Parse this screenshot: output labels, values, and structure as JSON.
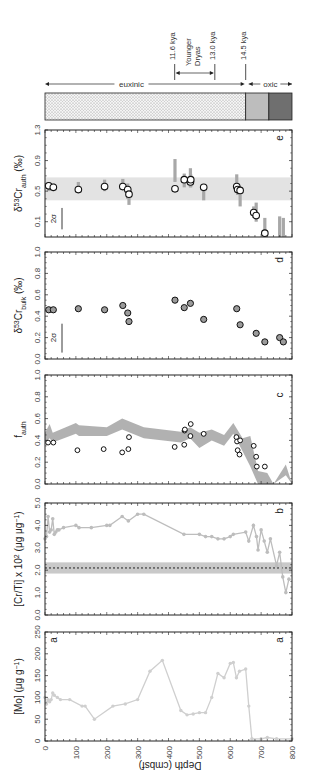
{
  "figure": {
    "orientation": "rotated-90-clockwise",
    "depth_axis": {
      "label": "Depth (cmbsf)",
      "ticks": [
        0,
        100,
        200,
        300,
        400,
        500,
        600,
        700,
        800
      ],
      "range": [
        0,
        800
      ]
    }
  },
  "redox_bar": {
    "segments": [
      {
        "label": "euxinic",
        "from": 0,
        "to": 650,
        "fill": "dotted"
      },
      {
        "label": "oxic",
        "from": 650,
        "to": 725,
        "fill": "#bdbdbd"
      },
      {
        "label": "oxic",
        "from": 725,
        "to": 800,
        "fill": "#6f6f6f"
      }
    ],
    "labels": {
      "euxinic": "euxinic",
      "oxic": "oxic"
    },
    "markers": [
      {
        "label": "11.6 kya",
        "depth": 420
      },
      {
        "label": "13.0 kya",
        "depth": 550
      },
      {
        "label": "14.5 kya",
        "depth": 650
      }
    ],
    "interval": {
      "label_line1": "Younger",
      "label_line2": "Dryas",
      "from": 420,
      "to": 550
    }
  },
  "chart_data": [
    {
      "panel": "e",
      "type": "scatter",
      "ylabel": "δ53Cr_auth (‰)",
      "ylabel_main": "δ",
      "ylabel_sup": "53",
      "ylabel_base": "Cr",
      "ylabel_sub": "auth",
      "ylabel_unit": " (‰)",
      "ylim": [
        -0.1,
        1.3
      ],
      "yticks": [
        0.1,
        0.5,
        0.9,
        1.3
      ],
      "ytick_labels": [
        "0.1",
        "0.5",
        "0.9",
        "1.3"
      ],
      "xlim": [
        0,
        800
      ],
      "band": [
        0.38,
        0.68
      ],
      "sigma_label": "2σ",
      "points": [
        {
          "x": 12,
          "y": 0.57,
          "err": [
            0.5,
            0.62
          ]
        },
        {
          "x": 27,
          "y": 0.55,
          "err": [
            0.5,
            0.6
          ]
        },
        {
          "x": 108,
          "y": 0.52,
          "err": [
            0.5,
            0.62
          ]
        },
        {
          "x": 193,
          "y": 0.56,
          "err": [
            0.5,
            0.65
          ]
        },
        {
          "x": 252,
          "y": 0.56,
          "err": [
            0.55,
            0.66
          ]
        },
        {
          "x": 268,
          "y": 0.52,
          "err": [
            0.4,
            0.6
          ]
        },
        {
          "x": 272,
          "y": 0.46,
          "err": [
            0.32,
            0.55
          ]
        },
        {
          "x": 421,
          "y": 0.53,
          "err": [
            0.62,
            0.92
          ]
        },
        {
          "x": 451,
          "y": 0.65,
          "err": [
            0.55,
            0.73
          ]
        },
        {
          "x": 471,
          "y": 0.62,
          "err": [
            0.55,
            0.8
          ]
        },
        {
          "x": 472,
          "y": 0.65,
          "err": [
            0.55,
            0.72
          ]
        },
        {
          "x": 514,
          "y": 0.55,
          "err": [
            0.38,
            0.55
          ]
        },
        {
          "x": 621,
          "y": 0.56,
          "err": [
            0.5,
            0.72
          ]
        },
        {
          "x": 624,
          "y": 0.52,
          "err": [
            0.45,
            0.6
          ]
        },
        {
          "x": 632,
          "y": 0.51,
          "err": [
            0.3,
            0.55
          ]
        },
        {
          "x": 676,
          "y": 0.22,
          "err": [
            0.15,
            0.3
          ]
        },
        {
          "x": 684,
          "y": 0.18,
          "err": [
            0.1,
            0.35
          ]
        },
        {
          "x": 712,
          "y": -0.05,
          "err": [
            -0.1,
            0.15
          ]
        },
        {
          "x": 760,
          "y": null,
          "err": [
            -0.1,
            0.17
          ]
        },
        {
          "x": 772,
          "y": null,
          "err": [
            -0.1,
            0.15
          ]
        }
      ],
      "panel_label": "e"
    },
    {
      "panel": "d",
      "type": "scatter",
      "ylabel": "δ53Cr_bulk (‰)",
      "ylabel_main": "δ",
      "ylabel_sup": "53",
      "ylabel_base": "Cr",
      "ylabel_sub": "bulk",
      "ylabel_unit": " (‰)",
      "ylim": [
        0.0,
        1.0
      ],
      "yticks": [
        0.0,
        0.2,
        0.4,
        0.6,
        0.8,
        1.0
      ],
      "ytick_labels": [
        "0.0",
        "0.2",
        "0.4",
        "0.6",
        "0.8",
        "1.0"
      ],
      "xlim": [
        0,
        800
      ],
      "sigma_label": "2σ",
      "points": [
        {
          "x": 12,
          "y": 0.46
        },
        {
          "x": 27,
          "y": 0.46
        },
        {
          "x": 108,
          "y": 0.47
        },
        {
          "x": 193,
          "y": 0.46
        },
        {
          "x": 252,
          "y": 0.5
        },
        {
          "x": 268,
          "y": 0.43
        },
        {
          "x": 272,
          "y": 0.35
        },
        {
          "x": 421,
          "y": 0.55
        },
        {
          "x": 451,
          "y": 0.48
        },
        {
          "x": 471,
          "y": 0.52
        },
        {
          "x": 514,
          "y": 0.37
        },
        {
          "x": 621,
          "y": 0.47
        },
        {
          "x": 632,
          "y": 0.32
        },
        {
          "x": 684,
          "y": 0.24
        },
        {
          "x": 712,
          "y": 0.16
        },
        {
          "x": 760,
          "y": 0.2
        },
        {
          "x": 772,
          "y": 0.16
        }
      ],
      "panel_label": "d"
    },
    {
      "panel": "c",
      "type": "area",
      "ylabel": "f_auth",
      "ylabel_base": "f",
      "ylabel_sub": "auth",
      "ylim": [
        0.0,
        1.0
      ],
      "yticks": [
        0.0,
        0.2,
        0.4,
        0.6,
        0.8,
        1.0
      ],
      "ytick_labels": [
        "0.0",
        "0.2",
        "0.4",
        "0.6",
        "0.8",
        "1.0"
      ],
      "xlim": [
        0,
        800
      ],
      "band_upper": [
        [
          0,
          0.47
        ],
        [
          15,
          0.55
        ],
        [
          25,
          0.47
        ],
        [
          100,
          0.56
        ],
        [
          110,
          0.54
        ],
        [
          200,
          0.52
        ],
        [
          250,
          0.6
        ],
        [
          320,
          0.52
        ],
        [
          440,
          0.48
        ],
        [
          470,
          0.52
        ],
        [
          500,
          0.47
        ],
        [
          540,
          0.5
        ],
        [
          580,
          0.45
        ],
        [
          610,
          0.56
        ],
        [
          640,
          0.42
        ],
        [
          665,
          0.44
        ],
        [
          690,
          0.12
        ],
        [
          720,
          0.1
        ],
        [
          740,
          0.0
        ],
        [
          780,
          0.18
        ],
        [
          800,
          0.0
        ]
      ],
      "band_lower": [
        [
          0,
          0.38
        ],
        [
          15,
          0.42
        ],
        [
          25,
          0.38
        ],
        [
          100,
          0.46
        ],
        [
          110,
          0.44
        ],
        [
          200,
          0.44
        ],
        [
          250,
          0.5
        ],
        [
          320,
          0.42
        ],
        [
          440,
          0.38
        ],
        [
          470,
          0.42
        ],
        [
          500,
          0.33
        ],
        [
          540,
          0.4
        ],
        [
          580,
          0.35
        ],
        [
          610,
          0.46
        ],
        [
          640,
          0.3
        ],
        [
          665,
          0.16
        ],
        [
          690,
          0.0
        ],
        [
          720,
          0.0
        ],
        [
          740,
          0.0
        ],
        [
          780,
          0.08
        ],
        [
          800,
          0.0
        ]
      ],
      "points": [
        {
          "x": 10,
          "y": 0.38
        },
        {
          "x": 27,
          "y": 0.38
        },
        {
          "x": 105,
          "y": 0.31
        },
        {
          "x": 190,
          "y": 0.32
        },
        {
          "x": 250,
          "y": 0.29
        },
        {
          "x": 270,
          "y": 0.32
        },
        {
          "x": 272,
          "y": 0.43
        },
        {
          "x": 420,
          "y": 0.34
        },
        {
          "x": 451,
          "y": 0.36
        },
        {
          "x": 452,
          "y": 0.49
        },
        {
          "x": 453,
          "y": 0.5
        },
        {
          "x": 471,
          "y": 0.44
        },
        {
          "x": 472,
          "y": 0.55
        },
        {
          "x": 514,
          "y": 0.46
        },
        {
          "x": 620,
          "y": 0.43
        },
        {
          "x": 622,
          "y": 0.39
        },
        {
          "x": 624,
          "y": 0.31
        },
        {
          "x": 630,
          "y": 0.27
        },
        {
          "x": 632,
          "y": 0.4
        },
        {
          "x": 676,
          "y": 0.35
        },
        {
          "x": 684,
          "y": 0.25
        },
        {
          "x": 686,
          "y": 0.16
        },
        {
          "x": 712,
          "y": 0.16
        }
      ],
      "panel_label": "c"
    },
    {
      "panel": "b",
      "type": "line",
      "ylabel": "[Cr/Ti] x 10^2 (μg μg^-1)",
      "ylabel_text": "[Cr/Ti] x 10",
      "ylabel_sup1": "2",
      "ylabel_unit": " (μg μg",
      "ylabel_sup2": "−1",
      "ylabel_close": ")",
      "ylim": [
        0.0,
        5.0
      ],
      "yticks": [
        0.0,
        1.0,
        2.0,
        3.0,
        4.0,
        5.0
      ],
      "ytick_labels": [
        "0.0",
        "1.0",
        "2.0",
        "3.0",
        "4.0",
        "5.0"
      ],
      "xlim": [
        0,
        800
      ],
      "reference_line": 2.1,
      "reference_band": [
        1.85,
        2.35
      ],
      "series": [
        {
          "name": "Cr/Ti",
          "x": [
            0,
            5,
            10,
            15,
            20,
            25,
            30,
            35,
            40,
            45,
            60,
            100,
            110,
            150,
            200,
            210,
            250,
            270,
            300,
            320,
            450,
            500,
            520,
            540,
            560,
            580,
            600,
            610,
            650,
            660,
            675,
            685,
            690,
            700,
            710,
            720,
            730,
            750,
            760,
            770,
            780,
            790
          ],
          "y": [
            3.4,
            3.5,
            4.4,
            3.7,
            3.8,
            4.3,
            3.6,
            3.7,
            3.8,
            3.8,
            3.9,
            4.0,
            3.9,
            3.9,
            4.0,
            4.0,
            4.4,
            4.2,
            4.5,
            4.5,
            3.6,
            3.6,
            3.5,
            3.5,
            3.4,
            3.4,
            3.5,
            3.6,
            3.7,
            3.3,
            4.0,
            3.5,
            2.9,
            3.8,
            3.3,
            2.8,
            3.4,
            2.2,
            2.8,
            1.7,
            1.0,
            1.6
          ]
        }
      ],
      "panel_label": "b"
    },
    {
      "panel": "a",
      "type": "line",
      "ylabel": "[Mo] (μg g^-1)",
      "ylabel_text": "[Mo] (μg g",
      "ylabel_sup": "−1",
      "ylabel_close": ")",
      "ylim": [
        0,
        250
      ],
      "yticks": [
        0,
        50,
        100,
        150,
        200,
        250
      ],
      "ytick_labels": [
        "0",
        "50",
        "100",
        "150",
        "200",
        "250"
      ],
      "xlim": [
        0,
        800
      ],
      "series": [
        {
          "name": "Mo",
          "x": [
            0,
            5,
            10,
            15,
            20,
            25,
            30,
            40,
            50,
            80,
            120,
            130,
            160,
            220,
            260,
            300,
            340,
            380,
            440,
            460,
            480,
            500,
            520,
            540,
            560,
            580,
            600,
            610,
            620,
            630,
            650,
            660,
            670,
            700,
            720,
            750,
            800
          ],
          "y": [
            100,
            85,
            95,
            90,
            95,
            110,
            105,
            100,
            95,
            95,
            80,
            80,
            50,
            80,
            85,
            95,
            160,
            185,
            70,
            60,
            62,
            65,
            65,
            100,
            155,
            145,
            178,
            180,
            145,
            160,
            165,
            80,
            5,
            5,
            8,
            5,
            5
          ]
        }
      ],
      "panel_label_left": "a",
      "panel_label": "a"
    }
  ]
}
